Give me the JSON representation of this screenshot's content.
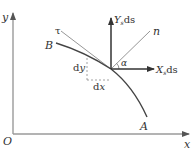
{
  "diagram": {
    "type": "force-element-on-curved-boundary",
    "colors": {
      "axis": "#9a9a9a",
      "curve": "#444444",
      "arrow": "#333333",
      "thin_line": "#8a8a8a",
      "dashed": "#8a8a8a",
      "text": "#333333"
    },
    "axes": {
      "origin_label": "O",
      "x_label": "x",
      "y_label": "y"
    },
    "curve": {
      "start_label": "B",
      "end_label": "A"
    },
    "vectors": {
      "y_force": {
        "main": "Y",
        "sub": "s",
        "tail": "ds"
      },
      "x_force": {
        "main": "X",
        "sub": "s",
        "tail": "ds"
      }
    },
    "lines": {
      "normal_label": "n",
      "tangent_label": "τ"
    },
    "angle_label": "α",
    "differentials": {
      "dy": "dy",
      "dx": "dx"
    }
  }
}
